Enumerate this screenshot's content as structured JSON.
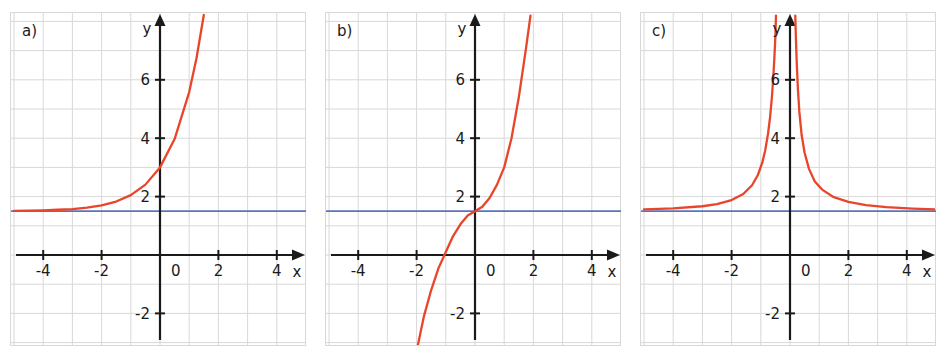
{
  "figure": {
    "panel_count": 3,
    "background_color": "#ffffff",
    "grid_color": "#d8d8d8",
    "axis_color": "#1a1a1a",
    "curve_color": "#e8452a",
    "asymptote_color": "#5b74b8"
  },
  "panels": [
    {
      "id": "a)",
      "xlabel": "x",
      "ylabel": "y",
      "xticks": [
        -4,
        -2,
        0,
        2,
        4
      ],
      "xticklabels": [
        "-4",
        "-2",
        "0",
        "2",
        "4"
      ],
      "yticks": [
        -2,
        2,
        4,
        6
      ],
      "yticklabels": [
        "-2",
        "2",
        "4",
        "6"
      ],
      "xlim": [
        -5.1,
        5.1
      ],
      "ylim": [
        -3.3,
        8.2
      ],
      "curve_kind": "exponential-growth",
      "asymptote_y": 1.5,
      "y_intercept": 3.0
    },
    {
      "id": "b)",
      "xlabel": "x",
      "ylabel": "y",
      "xticks": [
        -4,
        -2,
        0,
        2,
        4
      ],
      "xticklabels": [
        "-4",
        "-2",
        "0",
        "2",
        "4"
      ],
      "yticks": [
        -2,
        2,
        4,
        6
      ],
      "yticklabels": [
        "-2",
        "2",
        "4",
        "6"
      ],
      "xlim": [
        -5.1,
        5.1
      ],
      "ylim": [
        -3.3,
        8.2
      ],
      "curve_kind": "cubic-increasing",
      "asymptote_y": 1.5,
      "y_intercept": 1.5
    },
    {
      "id": "c)",
      "xlabel": "x",
      "ylabel": "y",
      "xticks": [
        -4,
        -2,
        0,
        2,
        4
      ],
      "xticklabels": [
        "-4",
        "-2",
        "0",
        "2",
        "4"
      ],
      "yticks": [
        -2,
        2,
        4,
        6
      ],
      "yticklabels": [
        "-2",
        "2",
        "4",
        "6"
      ],
      "xlim": [
        -5.1,
        5.1
      ],
      "ylim": [
        -3.3,
        8.2
      ],
      "curve_kind": "even-pole-at-origin",
      "asymptote_y": 1.5,
      "vertical_asymptote_x": 0.0
    }
  ],
  "chart_data": {
    "type": "line",
    "title": "",
    "xlabel": "x",
    "ylabel": "y",
    "grid": true,
    "legend": null,
    "xlim": [
      -5.1,
      5.1
    ],
    "ylim": [
      -3.3,
      8.2
    ],
    "subplots": [
      {
        "label": "a)",
        "series": [
          {
            "name": "exponential curve",
            "color": "#e8452a",
            "points": [
              {
                "x": -5.0,
                "y": 1.51
              },
              {
                "x": -4.5,
                "y": 1.52
              },
              {
                "x": -4.0,
                "y": 1.53
              },
              {
                "x": -3.5,
                "y": 1.55
              },
              {
                "x": -3.0,
                "y": 1.57
              },
              {
                "x": -2.5,
                "y": 1.62
              },
              {
                "x": -2.0,
                "y": 1.7
              },
              {
                "x": -1.5,
                "y": 1.83
              },
              {
                "x": -1.0,
                "y": 2.05
              },
              {
                "x": -0.5,
                "y": 2.41
              },
              {
                "x": 0.0,
                "y": 3.0
              },
              {
                "x": 0.5,
                "y": 3.97
              },
              {
                "x": 1.0,
                "y": 5.58
              },
              {
                "x": 1.25,
                "y": 6.74
              },
              {
                "x": 1.5,
                "y": 8.22
              }
            ]
          },
          {
            "name": "horizontal asymptote",
            "color": "#5b74b8",
            "points": [
              {
                "x": -5.1,
                "y": 1.5
              },
              {
                "x": 5.1,
                "y": 1.5
              }
            ]
          }
        ]
      },
      {
        "label": "b)",
        "series": [
          {
            "name": "cubic curve",
            "color": "#e8452a",
            "points": [
              {
                "x": -2.0,
                "y": -3.3
              },
              {
                "x": -1.75,
                "y": -2.1
              },
              {
                "x": -1.5,
                "y": -1.2
              },
              {
                "x": -1.25,
                "y": -0.45
              },
              {
                "x": -1.0,
                "y": 0.1
              },
              {
                "x": -0.75,
                "y": 0.65
              },
              {
                "x": -0.5,
                "y": 1.05
              },
              {
                "x": -0.25,
                "y": 1.35
              },
              {
                "x": 0.0,
                "y": 1.5
              },
              {
                "x": 0.25,
                "y": 1.65
              },
              {
                "x": 0.5,
                "y": 1.95
              },
              {
                "x": 0.75,
                "y": 2.4
              },
              {
                "x": 1.0,
                "y": 3.0
              },
              {
                "x": 1.25,
                "y": 4.0
              },
              {
                "x": 1.5,
                "y": 5.4
              },
              {
                "x": 1.75,
                "y": 7.1
              },
              {
                "x": 1.9,
                "y": 8.2
              }
            ]
          },
          {
            "name": "horizontal line",
            "color": "#5b74b8",
            "points": [
              {
                "x": -5.1,
                "y": 1.5
              },
              {
                "x": 5.1,
                "y": 1.5
              }
            ]
          }
        ]
      },
      {
        "label": "c)",
        "series": [
          {
            "name": "left branch",
            "color": "#e8452a",
            "points": [
              {
                "x": -5.0,
                "y": 1.56
              },
              {
                "x": -4.0,
                "y": 1.6
              },
              {
                "x": -3.0,
                "y": 1.67
              },
              {
                "x": -2.5,
                "y": 1.74
              },
              {
                "x": -2.0,
                "y": 1.88
              },
              {
                "x": -1.6,
                "y": 2.09
              },
              {
                "x": -1.3,
                "y": 2.39
              },
              {
                "x": -1.1,
                "y": 2.74
              },
              {
                "x": -0.95,
                "y": 3.16
              },
              {
                "x": -0.85,
                "y": 3.58
              },
              {
                "x": -0.75,
                "y": 4.17
              },
              {
                "x": -0.68,
                "y": 4.74
              },
              {
                "x": -0.62,
                "y": 5.4
              },
              {
                "x": -0.57,
                "y": 6.12
              },
              {
                "x": -0.53,
                "y": 6.85
              },
              {
                "x": -0.5,
                "y": 7.5
              },
              {
                "x": -0.48,
                "y": 8.2
              }
            ]
          },
          {
            "name": "right branch",
            "color": "#e8452a",
            "points": [
              {
                "x": 0.18,
                "y": 8.2
              },
              {
                "x": 0.2,
                "y": 7.5
              },
              {
                "x": 0.23,
                "y": 6.6
              },
              {
                "x": 0.27,
                "y": 5.7
              },
              {
                "x": 0.32,
                "y": 4.9
              },
              {
                "x": 0.4,
                "y": 4.1
              },
              {
                "x": 0.5,
                "y": 3.5
              },
              {
                "x": 0.65,
                "y": 2.95
              },
              {
                "x": 0.85,
                "y": 2.52
              },
              {
                "x": 1.1,
                "y": 2.24
              },
              {
                "x": 1.5,
                "y": 1.98
              },
              {
                "x": 2.0,
                "y": 1.82
              },
              {
                "x": 2.6,
                "y": 1.71
              },
              {
                "x": 3.3,
                "y": 1.64
              },
              {
                "x": 4.2,
                "y": 1.59
              },
              {
                "x": 5.0,
                "y": 1.56
              }
            ]
          },
          {
            "name": "horizontal asymptote",
            "color": "#5b74b8",
            "points": [
              {
                "x": -5.1,
                "y": 1.5
              },
              {
                "x": 5.1,
                "y": 1.5
              }
            ]
          }
        ]
      }
    ]
  }
}
